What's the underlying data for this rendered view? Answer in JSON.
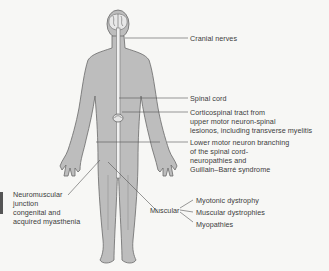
{
  "diagram": {
    "colors": {
      "body_fill": "#bdbdbd",
      "outline": "#6a6a6a",
      "spinal_cord": "#f0f0f0",
      "leader_line": "#555555",
      "background": "#f7f7f5"
    },
    "labels": {
      "cranial_nerves": "Cranial nerves",
      "spinal_cord": "Spinal cord",
      "corticospinal": {
        "line1": "Corticospinal tract from",
        "line2": "upper motor neuron-spinal",
        "line3": "lesionos, including transverse myelitis"
      },
      "lower_motor": {
        "line1": "Lower motor neuron branching",
        "line2": "of the spinal cord-",
        "line3": "neuropathies and",
        "line4": "Guillain–Barré syndrome"
      },
      "neuromuscular": {
        "line1": "Neuromuscular",
        "line2": "junction",
        "line3": "congenital and",
        "line4": "acquired myasthenia"
      },
      "muscular": {
        "heading": "Muscular",
        "items": [
          "Myotonic dystrophy",
          "Muscular dystrophies",
          "Myopathies"
        ]
      }
    }
  }
}
